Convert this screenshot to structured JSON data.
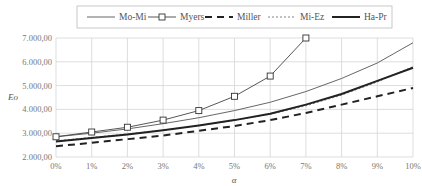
{
  "chart_data": {
    "type": "line",
    "title": "",
    "xlabel": "α",
    "ylabel": "Eo",
    "x": [
      "0%",
      "1%",
      "2%",
      "3%",
      "4%",
      "5%",
      "6%",
      "7%",
      "8%",
      "9%",
      "10%"
    ],
    "ylim": [
      2000,
      7000
    ],
    "yticks": [
      "2.000,00",
      "3.000,00",
      "4.000,00",
      "5.000,00",
      "6.000,00",
      "7.000,00"
    ],
    "grid": true,
    "legend_position": "top",
    "series": [
      {
        "name": "Mo-Mi",
        "style": "thin-solid",
        "values": [
          2850,
          3000,
          3180,
          3400,
          3650,
          3950,
          4300,
          4750,
          5300,
          5950,
          6800
        ]
      },
      {
        "name": "Myers",
        "style": "thin-solid-square-markers",
        "values": [
          2850,
          3050,
          3250,
          3550,
          3950,
          4550,
          5400,
          7000,
          null,
          null,
          null
        ]
      },
      {
        "name": "Miller",
        "style": "thick-dashed",
        "values": [
          2450,
          2600,
          2750,
          2900,
          3100,
          3300,
          3550,
          3850,
          4200,
          4550,
          4900
        ]
      },
      {
        "name": "Mi-Ez",
        "style": "thin-dotted",
        "values": [
          2680,
          2820,
          2970,
          3130,
          3320,
          3540,
          3800,
          4150,
          4600,
          5150,
          5800
        ]
      },
      {
        "name": "Ha-Pr",
        "style": "thick-solid",
        "values": [
          2650,
          2800,
          2950,
          3120,
          3320,
          3550,
          3820,
          4200,
          4650,
          5200,
          5750
        ]
      }
    ]
  }
}
